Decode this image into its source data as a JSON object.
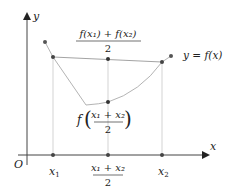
{
  "diagram": {
    "axes": {
      "x_label": "x",
      "y_label": "y",
      "origin_label": "O"
    },
    "curve_label": "y = f(x)",
    "labels": {
      "x1": "x",
      "x1_sub": "1",
      "x2": "x",
      "x2_sub": "2",
      "mid_num": "x₁ + x₂",
      "mid_den": "2",
      "chord_mid_num": "f(x₁) + f(x₂)",
      "chord_mid_den": "2",
      "f_mid_prefix": "f",
      "f_mid_num": "x₁ + x₂",
      "f_mid_den": "2"
    },
    "colors": {
      "axis": "#333333",
      "curve": "#aaaaaa",
      "chord": "#999999",
      "guide": "#bbbbbb",
      "point": "#333333"
    }
  }
}
